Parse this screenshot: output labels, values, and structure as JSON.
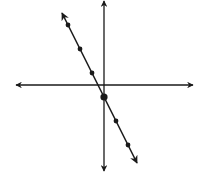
{
  "chart_data": {
    "type": "line",
    "title": "",
    "xlabel": "",
    "ylabel": "",
    "equation": "y = -2x - 1",
    "slope": -2,
    "y_intercept": -1,
    "grid": false,
    "axes_with_arrows": true,
    "unit_px": 12,
    "origin_px": [
      104,
      85
    ],
    "points": [
      {
        "x": -3,
        "y": 5
      },
      {
        "x": -2,
        "y": 3
      },
      {
        "x": -1,
        "y": 1
      },
      {
        "x": 0,
        "y": -1,
        "highlight": true
      },
      {
        "x": 1,
        "y": -3
      },
      {
        "x": 2,
        "y": -5
      }
    ],
    "line_extent_x": [
      -3.5,
      2.75
    ],
    "axis_extent_px": {
      "x_axis": [
        16,
        193
      ],
      "y_axis": [
        1,
        171
      ]
    }
  },
  "colors": {
    "line": "#1a1a1a",
    "axis": "#1a1a1a",
    "background": "#ffffff"
  }
}
